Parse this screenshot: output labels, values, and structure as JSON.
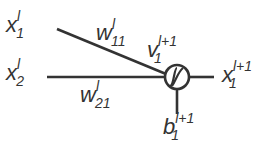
{
  "diagram": {
    "type": "neuron",
    "colors": {
      "line": "#333333",
      "background": "#ffffff"
    },
    "inputs": [
      {
        "base": "x",
        "sup": "l",
        "sub": "1",
        "weight": {
          "base": "w",
          "sup": "l",
          "sub": "11"
        }
      },
      {
        "base": "x",
        "sup": "l",
        "sub": "2",
        "weight": {
          "base": "w",
          "sup": "l",
          "sub": "21"
        }
      }
    ],
    "node": {
      "activation_icon": "sigmoid-icon",
      "net_input": {
        "base": "v",
        "sup": "l+1",
        "sub": "1"
      }
    },
    "output": {
      "base": "x",
      "sup": "l+1",
      "sub": "1"
    },
    "bias": {
      "base": "b",
      "sup": "l+1",
      "sub": "1"
    }
  }
}
